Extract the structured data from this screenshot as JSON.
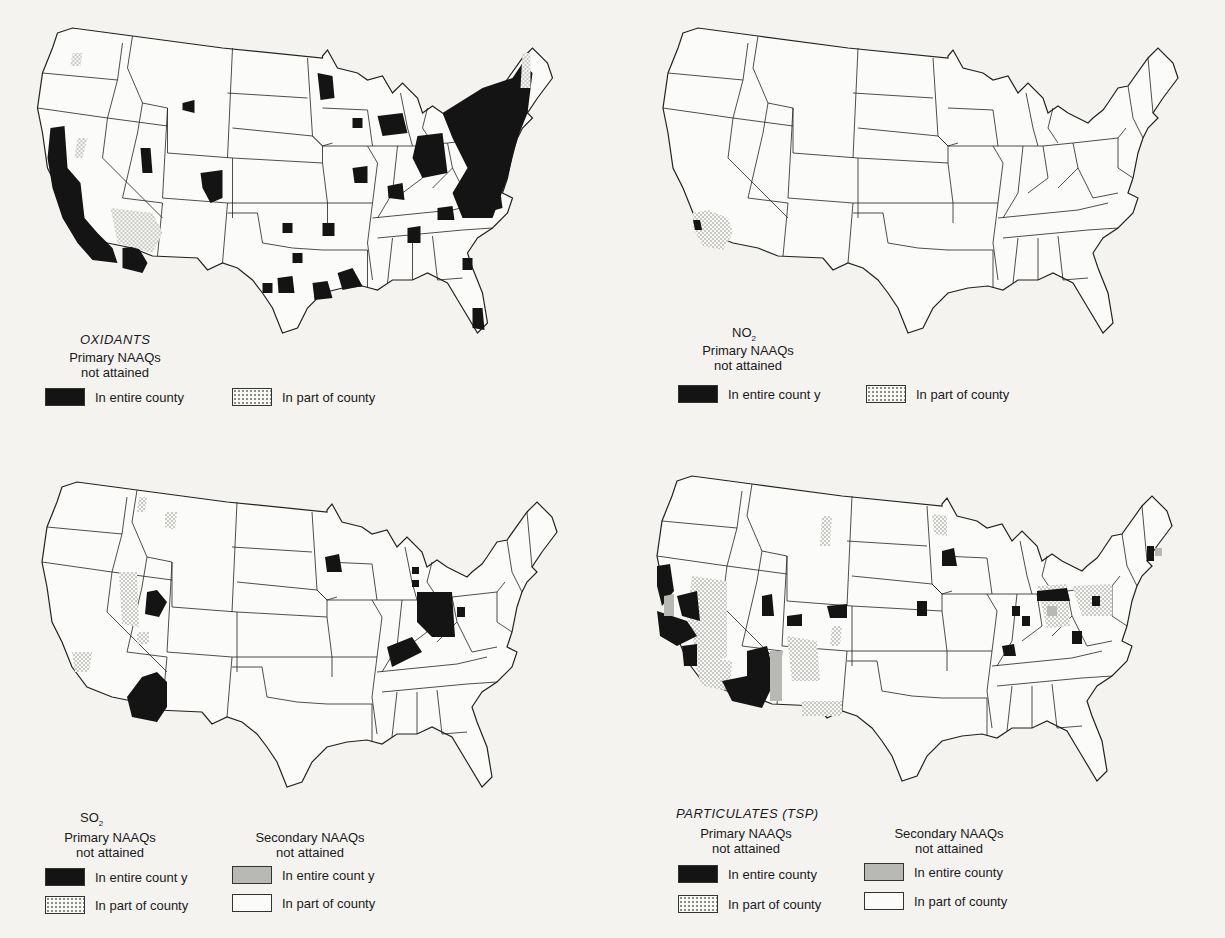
{
  "figure": {
    "panels": [
      {
        "id": "oxidants",
        "title": "OXIDANTS",
        "title_style": "italic",
        "legend_groups": [
          {
            "heading_line1": "Primary NAAQs",
            "heading_line2": "not attained",
            "items": [
              {
                "swatch": "black",
                "label": "In entire county"
              },
              {
                "swatch": "dots",
                "label": "In part of county"
              }
            ]
          }
        ]
      },
      {
        "id": "no2",
        "title": "NO",
        "title_sub": "2",
        "title_style": "normal",
        "legend_groups": [
          {
            "heading_line1": "Primary NAAQs",
            "heading_line2": "not attained",
            "items": [
              {
                "swatch": "black",
                "label": "In entire count y"
              },
              {
                "swatch": "dots",
                "label": "In part of county"
              }
            ]
          }
        ]
      },
      {
        "id": "so2",
        "title": "SO",
        "title_sub": "2",
        "title_style": "normal",
        "legend_groups": [
          {
            "heading_line1": "Primary NAAQs",
            "heading_line2": "not attained",
            "items": [
              {
                "swatch": "black",
                "label": "In entire count y"
              },
              {
                "swatch": "dots",
                "label": "In part of county"
              }
            ]
          },
          {
            "heading_line1": "Secondary NAAQs",
            "heading_line2": "not attained",
            "items": [
              {
                "swatch": "gray",
                "label": "In entire count y"
              },
              {
                "swatch": "white",
                "label": "In part of county"
              }
            ]
          }
        ]
      },
      {
        "id": "particulates",
        "title": "PARTICULATES (TSP)",
        "title_style": "italic",
        "legend_groups": [
          {
            "heading_line1": "Primary NAAQs",
            "heading_line2": "not attained",
            "items": [
              {
                "swatch": "black",
                "label": "In entire county"
              },
              {
                "swatch": "dots",
                "label": "In part of county"
              }
            ]
          },
          {
            "heading_line1": "Secondary NAAQs",
            "heading_line2": "not attained",
            "items": [
              {
                "swatch": "gray",
                "label": "In entire county"
              },
              {
                "swatch": "white",
                "label": "In part of county"
              }
            ]
          }
        ]
      }
    ]
  },
  "colors": {
    "background": "#f4f3f0",
    "entire_county_primary": "#141414",
    "entire_county_secondary": "#b8b8b4",
    "outline": "#222222"
  }
}
